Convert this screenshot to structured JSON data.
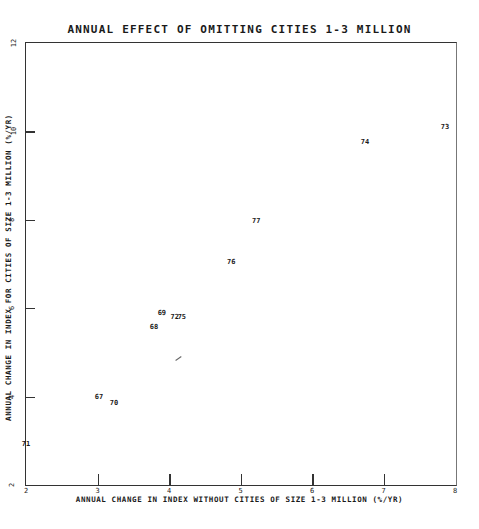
{
  "chart_data": {
    "type": "scatter",
    "title": "ANNUAL EFFECT OF OMITTING CITIES 1-3 MILLION",
    "xlabel": "ANNUAL CHANGE IN INDEX WITHOUT CITIES OF SIZE 1-3 MILLION (%/YR)",
    "ylabel": "ANNUAL CHANGE IN INDEX FOR CITIES OF SIZE 1-3 MILLION (%/YR)",
    "xlim": [
      2,
      8
    ],
    "ylim": [
      2,
      12
    ],
    "xticks": [
      "2",
      "3",
      "4",
      "5",
      "6",
      "7",
      "8"
    ],
    "yticks": [
      "2",
      "4",
      "6",
      "8",
      "10",
      "12"
    ],
    "grid": false,
    "legend": null,
    "points": [
      {
        "label": "67",
        "x": 3.02,
        "y": 4.0
      },
      {
        "label": "68",
        "x": 3.79,
        "y": 5.57
      },
      {
        "label": "69",
        "x": 3.9,
        "y": 5.9
      },
      {
        "label": "70",
        "x": 3.23,
        "y": 3.85
      },
      {
        "label": "71",
        "x": 2.0,
        "y": 2.93
      },
      {
        "label": "72",
        "x": 4.08,
        "y": 5.8
      },
      {
        "label": "73",
        "x": 7.86,
        "y": 10.1
      },
      {
        "label": "74",
        "x": 6.74,
        "y": 9.76
      },
      {
        "label": "75",
        "x": 4.18,
        "y": 5.8
      },
      {
        "label": "76",
        "x": 4.87,
        "y": 7.05
      },
      {
        "label": "77",
        "x": 5.22,
        "y": 7.97
      }
    ]
  }
}
